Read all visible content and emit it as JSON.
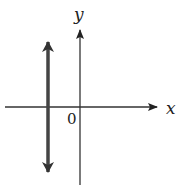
{
  "diagram": {
    "type": "coordinate-plane",
    "axes": {
      "x_label": "x",
      "y_label": "y",
      "origin_label": "0"
    },
    "line": {
      "kind": "vertical line with arrows at both ends",
      "position": "left of y-axis (negative x)",
      "color": "#444444"
    },
    "colors": {
      "axis": "#333333",
      "background": "#ffffff"
    }
  }
}
